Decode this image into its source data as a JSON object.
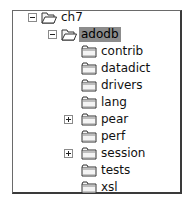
{
  "tree": {
    "root": {
      "label": "ch7",
      "expanded": true,
      "icon": "folder-open-icon"
    },
    "selected": {
      "label": "adodb",
      "expanded": true,
      "icon": "folder-open-icon",
      "highlight_color": "#8c8c8c"
    },
    "children": [
      {
        "label": "contrib",
        "has_children": false
      },
      {
        "label": "datadict",
        "has_children": false
      },
      {
        "label": "drivers",
        "has_children": false
      },
      {
        "label": "lang",
        "has_children": false
      },
      {
        "label": "pear",
        "has_children": true
      },
      {
        "label": "perf",
        "has_children": false
      },
      {
        "label": "session",
        "has_children": true
      },
      {
        "label": "tests",
        "has_children": false
      },
      {
        "label": "xsl",
        "has_children": false
      }
    ]
  }
}
